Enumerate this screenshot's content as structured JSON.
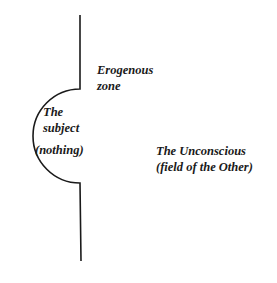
{
  "labels": {
    "erogenous_zone": [
      "Erogenous",
      "zone"
    ],
    "subject": [
      "The",
      "subject"
    ],
    "nothing": "(nothing)",
    "unconscious": [
      "The Unconscious",
      "(field of the Other)"
    ]
  },
  "colors": {
    "stroke": "#1a1a1a",
    "background": "#ffffff"
  }
}
